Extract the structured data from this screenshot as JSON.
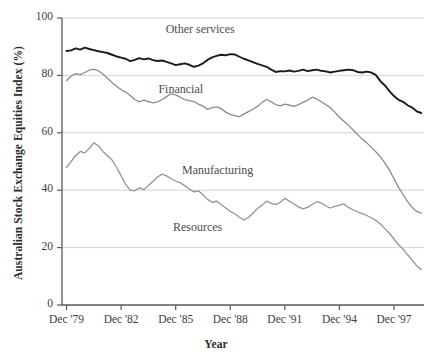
{
  "chart_data": {
    "type": "line",
    "title": "",
    "xlabel": "Year",
    "ylabel": "Australian Stock Exchange Equities Index (%)",
    "ylim": [
      0,
      100
    ],
    "yticks": [
      0,
      20,
      40,
      60,
      80,
      100
    ],
    "ytick_labels": [
      "0",
      "20",
      "40",
      "60",
      "80",
      "100"
    ],
    "xtick_labels": [
      "Dec '79",
      "Dec '82",
      "Dec '85",
      "Dec '88",
      "Dec '91",
      "Dec '94",
      "Dec '97"
    ],
    "xtick_values": [
      1979.95,
      1982.95,
      1985.95,
      1988.95,
      1991.95,
      1994.95,
      1997.95
    ],
    "xlim": [
      1979.7,
      1999.6
    ],
    "grid": "horizontal",
    "legend": "inline-annotations",
    "series": [
      {
        "name": "Other services",
        "color": "#1a1a1a",
        "width": 1.9,
        "label_x": 1985.4,
        "label_y": 95.5,
        "x": [
          1979.95,
          1980.2,
          1980.45,
          1980.7,
          1980.95,
          1981.2,
          1981.45,
          1981.7,
          1981.95,
          1982.2,
          1982.45,
          1982.7,
          1982.95,
          1983.2,
          1983.45,
          1983.7,
          1983.95,
          1984.2,
          1984.45,
          1984.7,
          1984.95,
          1985.2,
          1985.45,
          1985.7,
          1985.95,
          1986.2,
          1986.45,
          1986.7,
          1986.95,
          1987.2,
          1987.45,
          1987.7,
          1987.95,
          1988.2,
          1988.45,
          1988.7,
          1988.95,
          1989.2,
          1989.45,
          1989.7,
          1989.95,
          1990.2,
          1990.45,
          1990.7,
          1990.95,
          1991.2,
          1991.45,
          1991.7,
          1991.95,
          1992.2,
          1992.45,
          1992.7,
          1992.95,
          1993.2,
          1993.45,
          1993.7,
          1993.95,
          1994.2,
          1994.45,
          1994.7,
          1994.95,
          1995.2,
          1995.45,
          1995.7,
          1995.95,
          1996.2,
          1996.45,
          1996.7,
          1996.95,
          1997.2,
          1997.45,
          1997.7,
          1997.95,
          1998.2,
          1998.45,
          1998.7,
          1998.95,
          1999.2,
          1999.45
        ],
        "y": [
          88.5,
          88.7,
          89.4,
          89.0,
          89.7,
          89.2,
          88.8,
          88.4,
          88.1,
          87.8,
          87.2,
          86.6,
          86.2,
          85.8,
          85.0,
          85.4,
          86.0,
          85.6,
          85.9,
          85.3,
          85.0,
          85.2,
          84.7,
          84.2,
          83.6,
          83.9,
          84.2,
          83.7,
          83.0,
          83.4,
          84.2,
          85.4,
          86.3,
          86.8,
          87.2,
          87.0,
          87.4,
          87.3,
          86.5,
          85.8,
          85.2,
          84.6,
          84.0,
          83.5,
          83.0,
          82.0,
          81.2,
          81.5,
          81.4,
          81.7,
          81.3,
          81.6,
          82.0,
          81.5,
          81.8,
          82.0,
          81.6,
          81.4,
          81.0,
          81.3,
          81.6,
          81.8,
          82.0,
          81.8,
          81.2,
          81.0,
          81.3,
          81.0,
          80.2,
          78.0,
          76.5,
          74.5,
          72.8,
          71.5,
          70.8,
          69.6,
          68.8,
          67.5,
          66.9
        ]
      },
      {
        "name": "Financial",
        "color": "#8c8c8c",
        "width": 1.3,
        "label_x": 1985.0,
        "label_y": 74.5,
        "x": [
          1979.95,
          1980.2,
          1980.45,
          1980.7,
          1980.95,
          1981.2,
          1981.45,
          1981.7,
          1981.95,
          1982.2,
          1982.45,
          1982.7,
          1982.95,
          1983.2,
          1983.45,
          1983.7,
          1983.95,
          1984.2,
          1984.45,
          1984.7,
          1984.95,
          1985.2,
          1985.45,
          1985.7,
          1985.95,
          1986.2,
          1986.45,
          1986.7,
          1986.95,
          1987.2,
          1987.45,
          1987.7,
          1987.95,
          1988.2,
          1988.45,
          1988.7,
          1988.95,
          1989.2,
          1989.45,
          1989.7,
          1989.95,
          1990.2,
          1990.45,
          1990.7,
          1990.95,
          1991.2,
          1991.45,
          1991.7,
          1991.95,
          1992.2,
          1992.45,
          1992.7,
          1992.95,
          1993.2,
          1993.45,
          1993.7,
          1993.95,
          1994.2,
          1994.45,
          1994.7,
          1994.95,
          1995.2,
          1995.45,
          1995.7,
          1995.95,
          1996.2,
          1996.45,
          1996.7,
          1996.95,
          1997.2,
          1997.45,
          1997.7,
          1997.95,
          1998.2,
          1998.45,
          1998.7,
          1998.95,
          1999.2,
          1999.45
        ],
        "y": [
          78.2,
          79.8,
          80.6,
          80.3,
          81.0,
          81.8,
          82.2,
          81.6,
          80.5,
          79.0,
          77.5,
          76.2,
          75.0,
          74.2,
          73.0,
          71.6,
          70.8,
          71.4,
          70.9,
          70.4,
          70.8,
          71.6,
          72.6,
          73.6,
          73.2,
          72.4,
          71.6,
          71.2,
          70.9,
          70.0,
          69.3,
          68.2,
          68.8,
          69.0,
          68.4,
          67.2,
          66.4,
          66.0,
          65.6,
          66.6,
          67.4,
          68.2,
          69.2,
          70.6,
          71.6,
          70.8,
          69.8,
          69.4,
          70.0,
          69.6,
          69.2,
          69.8,
          70.6,
          71.4,
          72.4,
          71.8,
          70.8,
          69.8,
          68.8,
          67.2,
          65.4,
          64.0,
          62.6,
          61.0,
          59.4,
          57.8,
          56.5,
          55.0,
          53.4,
          51.6,
          49.5,
          47.0,
          44.0,
          41.0,
          38.5,
          36.0,
          34.0,
          32.6,
          32.0
        ]
      },
      {
        "name": "Manufacturing",
        "color": "#949494",
        "width": 1.3,
        "label_x": 1986.3,
        "label_y": 46.5,
        "x": [
          1979.95,
          1980.2,
          1980.45,
          1980.7,
          1980.95,
          1981.2,
          1981.45,
          1981.7,
          1981.95,
          1982.2,
          1982.45,
          1982.7,
          1982.95,
          1983.2,
          1983.45,
          1983.7,
          1983.95,
          1984.2,
          1984.45,
          1984.7,
          1984.95,
          1985.2,
          1985.45,
          1985.7,
          1985.95,
          1986.2,
          1986.45,
          1986.7,
          1986.95,
          1987.2,
          1987.45,
          1987.7,
          1987.95,
          1988.2,
          1988.45,
          1988.7,
          1988.95,
          1989.2,
          1989.45,
          1989.7,
          1989.95,
          1990.2,
          1990.45,
          1990.7,
          1990.95,
          1991.2,
          1991.45,
          1991.7,
          1991.95,
          1992.2,
          1992.45,
          1992.7,
          1992.95,
          1993.2,
          1993.45,
          1993.7,
          1993.95,
          1994.2,
          1994.45,
          1994.7,
          1994.95,
          1995.2,
          1995.45,
          1995.7,
          1995.95,
          1996.2,
          1996.45,
          1996.7,
          1996.95,
          1997.2,
          1997.45,
          1997.7,
          1997.95,
          1998.2,
          1998.45,
          1998.7,
          1998.95,
          1999.2,
          1999.45
        ],
        "y": [
          48.0,
          50.0,
          52.0,
          53.5,
          53.0,
          54.5,
          56.5,
          55.5,
          53.5,
          52.0,
          50.5,
          48.0,
          45.0,
          42.0,
          40.0,
          39.8,
          40.8,
          40.2,
          41.6,
          43.0,
          44.6,
          45.6,
          45.0,
          44.0,
          43.2,
          42.6,
          41.6,
          40.4,
          39.4,
          39.8,
          38.4,
          36.8,
          35.8,
          36.2,
          35.0,
          33.8,
          32.6,
          31.8,
          30.6,
          29.6,
          30.5,
          32.0,
          33.6,
          34.8,
          36.2,
          35.4,
          35.0,
          35.8,
          37.2,
          36.2,
          35.2,
          34.2,
          33.5,
          34.0,
          35.0,
          36.0,
          35.5,
          34.5,
          33.8,
          34.4,
          34.8,
          35.2,
          34.0,
          33.2,
          32.4,
          31.8,
          31.2,
          30.4,
          29.5,
          28.2,
          26.6,
          25.0,
          23.0,
          21.0,
          19.5,
          17.5,
          15.6,
          13.6,
          12.4
        ]
      },
      {
        "name": "Resources",
        "color": "#949494",
        "width": 1.3,
        "label_x": 1985.8,
        "label_y": 26.5,
        "x": [],
        "y": []
      }
    ],
    "series_notes": "Four labelled curves; 'Resources' annotates the lower grey curve and 'Manufacturing' the upper grey curve of the lower pair."
  },
  "annotations": {
    "other_services": "Other services",
    "financial": "Financial",
    "manufacturing": "Manufacturing",
    "resources": "Resources"
  },
  "axis": {
    "y_title": "Australian Stock Exchange Equities Index (%)",
    "x_title": "Year"
  },
  "colors": {
    "line_dark": "#1a1a1a",
    "line_grey": "#949494",
    "grid": "#c8c8c8",
    "axis": "#5a5a5a",
    "text": "#3d3d3d"
  }
}
